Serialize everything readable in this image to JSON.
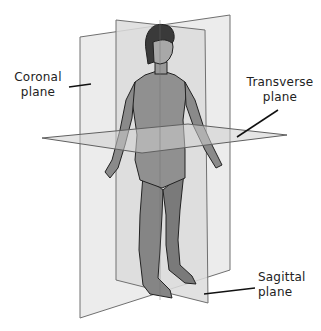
{
  "diagram": {
    "labels": {
      "coronal": {
        "line1": "Coronal",
        "line2": "plane"
      },
      "transverse": {
        "line1": "Transverse",
        "line2": "plane"
      },
      "sagittal": {
        "line1": "Sagittal",
        "line2": "plane"
      }
    },
    "colors": {
      "plane_fill": "#e8e8e8",
      "plane_edge": "#707070",
      "body_fill": "#8c8c8c",
      "hair": "#3a3a3a",
      "leader_line": "#111111"
    }
  }
}
